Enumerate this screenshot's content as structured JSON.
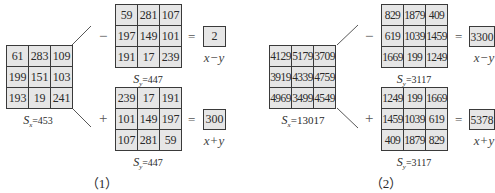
{
  "panels": [
    {
      "caption": "（1）",
      "source_grid": {
        "cells": [
          "61",
          "283",
          "109",
          "199",
          "151",
          "103",
          "193",
          "19",
          "241"
        ],
        "sum_label": "S",
        "sum_sub": "x",
        "sum_value": "=453"
      },
      "top": {
        "operator": "−",
        "grid": {
          "cells": [
            "59",
            "281",
            "107",
            "197",
            "149",
            "101",
            "191",
            "17",
            "239"
          ]
        },
        "equals": "=",
        "result": "2",
        "expression": "x−y",
        "sum_label": "S",
        "sum_sub": "y",
        "sum_value": "=447"
      },
      "bottom": {
        "operator": "+",
        "grid": {
          "cells": [
            "239",
            "17",
            "191",
            "101",
            "149",
            "197",
            "107",
            "281",
            "59"
          ]
        },
        "equals": "=",
        "result": "300",
        "expression": "x+y",
        "sum_label": "S",
        "sum_sub": "y",
        "sum_value": "=447"
      }
    },
    {
      "caption": "（2）",
      "source_grid": {
        "cells": [
          "4129",
          "5179",
          "3709",
          "3919",
          "4339",
          "4759",
          "4969",
          "3499",
          "4549"
        ],
        "sum_label": "S",
        "sum_sub": "x",
        "sum_value": "=13017"
      },
      "top": {
        "operator": "−",
        "grid": {
          "cells": [
            "829",
            "1879",
            "409",
            "619",
            "1039",
            "1459",
            "1669",
            "199",
            "1249"
          ]
        },
        "equals": "=",
        "result": "3300",
        "expression": "x−y",
        "sum_label": "S",
        "sum_sub": "y",
        "sum_value": "=3117"
      },
      "bottom": {
        "operator": "+",
        "grid": {
          "cells": [
            "1249",
            "199",
            "1669",
            "1459",
            "1039",
            "619",
            "409",
            "1879",
            "829"
          ]
        },
        "equals": "=",
        "result": "5378",
        "expression": "x+y",
        "sum_label": "S",
        "sum_sub": "y",
        "sum_value": "=3117"
      }
    }
  ],
  "colors": {
    "cell_fill": "#e6e6e6",
    "border": "#3a3a3a",
    "background": "#ffffff"
  }
}
